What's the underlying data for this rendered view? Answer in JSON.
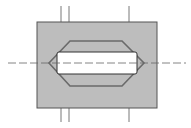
{
  "diagram": {
    "type": "technical-cross-section",
    "colors": {
      "background": "#ffffff",
      "block_fill": "#bdbdbd",
      "block_stroke": "#555555",
      "octagon_stroke": "#6a6a6a",
      "slot_fill": "#ffffff",
      "slot_stroke": "#333333",
      "centerline": "#666666"
    },
    "block": {
      "x": 37,
      "y": 22,
      "width": 120,
      "height": 86
    },
    "octagon": {
      "points": "70,41 122,41 144,63 122,86 70,86 49,63"
    },
    "slot": {
      "x": 57,
      "y": 52,
      "width": 80,
      "height": 22,
      "rx": 2
    },
    "centerline_horizontal": {
      "y": 63,
      "x1": 8,
      "x2": 186
    },
    "vertical_lines_top": [
      {
        "x": 61
      },
      {
        "x": 69
      },
      {
        "x": 129
      }
    ],
    "vertical_lines_bottom": [
      {
        "x": 61
      },
      {
        "x": 69
      },
      {
        "x": 129
      }
    ]
  }
}
